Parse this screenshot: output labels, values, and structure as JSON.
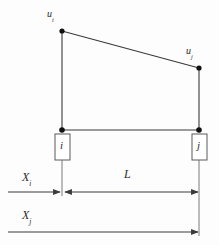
{
  "figure": {
    "type": "diagram",
    "name": "beam-element-displacement-diagram",
    "background_color": "#fdfdfd",
    "line_color": "#3a3a3a",
    "node_fill": "#111111"
  },
  "labels": {
    "u_i": {
      "base": "u",
      "sub": "i"
    },
    "u_j": {
      "base": "u",
      "sub": "j"
    },
    "X_i": {
      "base": "X",
      "sub": "i"
    },
    "X_j": {
      "base": "X",
      "sub": "j"
    },
    "L": "L",
    "node_i": "i",
    "node_j": "j"
  },
  "geometry": {
    "node_i": {
      "x": 62,
      "y": 130
    },
    "node_j": {
      "x": 199,
      "y": 130
    },
    "top_i": {
      "x": 62,
      "y": 31
    },
    "top_j": {
      "x": 199,
      "y": 68
    },
    "box_i": {
      "x": 55,
      "y": 134,
      "w": 15,
      "h": 26
    },
    "box_j": {
      "x": 192,
      "y": 134,
      "w": 15,
      "h": 26
    },
    "dim_L_y": 192,
    "dim_Xi_y": 192,
    "dim_Xj_y": 232,
    "left_margin_x": 8
  }
}
